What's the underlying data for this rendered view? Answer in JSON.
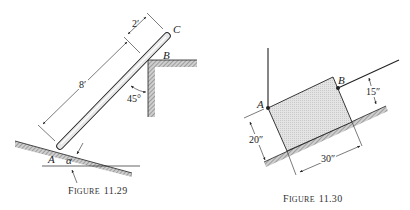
{
  "figures": [
    {
      "caption_prefix": "F",
      "caption_smallcaps": "IGURE",
      "caption_number": "11.29",
      "labels": {
        "A": "A",
        "B": "B",
        "C": "C",
        "alpha": "α"
      },
      "dimensions": {
        "rod_length": "8′",
        "overhang": "2′",
        "angle": "45°"
      }
    },
    {
      "caption_prefix": "F",
      "caption_smallcaps": "IGURE",
      "caption_number": "11.30",
      "labels": {
        "A": "A",
        "B": "B"
      },
      "dimensions": {
        "height": "20″",
        "width": "30″",
        "rope_height": "15″"
      }
    }
  ]
}
